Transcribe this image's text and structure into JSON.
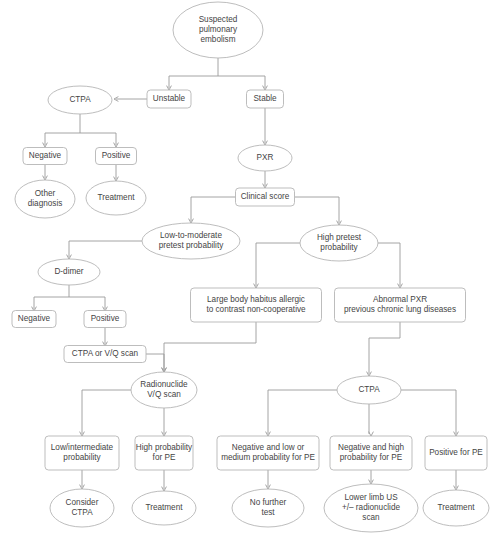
{
  "diagram": {
    "type": "flowchart",
    "colors": {
      "background": "#ffffff",
      "node_stroke": "#b5b5b5",
      "node_fill": "#ffffff",
      "edge_stroke": "#9a9a9a",
      "text": "#444444"
    },
    "nodes": [
      {
        "id": "suspected",
        "shape": "ellipse",
        "lines": [
          "Suspected",
          "pulmonary",
          "embolism"
        ],
        "cx": 218,
        "cy": 30,
        "rw": 45,
        "rh": 28
      },
      {
        "id": "unstable",
        "shape": "box",
        "lines": [
          "Unstable"
        ],
        "cx": 169,
        "cy": 99,
        "w": 44,
        "h": 18
      },
      {
        "id": "stable",
        "shape": "box",
        "lines": [
          "Stable"
        ],
        "cx": 265,
        "cy": 99,
        "w": 37,
        "h": 18
      },
      {
        "id": "ctpa_top",
        "shape": "ellipse",
        "lines": [
          "CTPA"
        ],
        "cx": 80,
        "cy": 100,
        "rw": 32,
        "rh": 14
      },
      {
        "id": "negative_top",
        "shape": "box",
        "lines": [
          "Negative"
        ],
        "cx": 45,
        "cy": 156,
        "w": 44,
        "h": 17
      },
      {
        "id": "positive_top",
        "shape": "box",
        "lines": [
          "Positive"
        ],
        "cx": 116,
        "cy": 156,
        "w": 41,
        "h": 17
      },
      {
        "id": "other_diag",
        "shape": "ellipse",
        "lines": [
          "Other",
          "diagnosis"
        ],
        "cx": 45,
        "cy": 199,
        "rw": 30,
        "rh": 19
      },
      {
        "id": "treatment_top",
        "shape": "ellipse",
        "lines": [
          "Treatment"
        ],
        "cx": 116,
        "cy": 198,
        "rw": 30,
        "rh": 17
      },
      {
        "id": "pxr",
        "shape": "ellipse",
        "lines": [
          "PXR"
        ],
        "cx": 265,
        "cy": 158,
        "rw": 27,
        "rh": 13
      },
      {
        "id": "clinical_score",
        "shape": "box",
        "lines": [
          "Clinical score"
        ],
        "cx": 265,
        "cy": 197,
        "w": 59,
        "h": 18
      },
      {
        "id": "low_mod",
        "shape": "ellipse",
        "lines": [
          "Low-to-moderate",
          "pretest probability"
        ],
        "cx": 191,
        "cy": 241,
        "rw": 49,
        "rh": 18
      },
      {
        "id": "high_pretest",
        "shape": "ellipse",
        "lines": [
          "High pretest",
          "probability"
        ],
        "cx": 339,
        "cy": 243,
        "rw": 39,
        "rh": 18
      },
      {
        "id": "d_dimer",
        "shape": "ellipse",
        "lines": [
          "D-dimer"
        ],
        "cx": 69,
        "cy": 272,
        "rw": 31,
        "rh": 13
      },
      {
        "id": "negative_dd",
        "shape": "box",
        "lines": [
          "Negative"
        ],
        "cx": 34,
        "cy": 319,
        "w": 44,
        "h": 17
      },
      {
        "id": "positive_dd",
        "shape": "box",
        "lines": [
          "Positive"
        ],
        "cx": 105,
        "cy": 319,
        "w": 42,
        "h": 17
      },
      {
        "id": "ctpa_vq",
        "shape": "box",
        "lines": [
          "CTPA or V/Q scan"
        ],
        "cx": 105,
        "cy": 354,
        "w": 82,
        "h": 17
      },
      {
        "id": "large_habitus",
        "shape": "box",
        "lines": [
          "Large body habitus allergic",
          "to contrast non-cooperative"
        ],
        "cx": 256,
        "cy": 305,
        "w": 131,
        "h": 34
      },
      {
        "id": "abnormal_pxr",
        "shape": "box",
        "lines": [
          "Abnormal PXR",
          "previous chronic lung diseases"
        ],
        "cx": 400,
        "cy": 305,
        "w": 131,
        "h": 34
      },
      {
        "id": "radionuclide",
        "shape": "ellipse",
        "lines": [
          "Radionuclide",
          "V/Q scan"
        ],
        "cx": 164,
        "cy": 390,
        "rw": 33,
        "rh": 18
      },
      {
        "id": "ctpa_bottom",
        "shape": "ellipse",
        "lines": [
          "CTPA"
        ],
        "cx": 369,
        "cy": 390,
        "rw": 32,
        "rh": 14
      },
      {
        "id": "low_inter",
        "shape": "box",
        "lines": [
          "Low/intermediate",
          "probability"
        ],
        "cx": 82,
        "cy": 453,
        "w": 74,
        "h": 34
      },
      {
        "id": "high_prob_pe",
        "shape": "box",
        "lines": [
          "High probability",
          "for PE"
        ],
        "cx": 164,
        "cy": 453,
        "w": 58,
        "h": 34
      },
      {
        "id": "neg_low_med",
        "shape": "box",
        "lines": [
          "Negative and low or",
          "medium probability for PE"
        ],
        "cx": 268,
        "cy": 453,
        "w": 102,
        "h": 34
      },
      {
        "id": "neg_high",
        "shape": "box",
        "lines": [
          "Negative and high",
          "probability for PE"
        ],
        "cx": 371,
        "cy": 453,
        "w": 82,
        "h": 34
      },
      {
        "id": "positive_pe",
        "shape": "box",
        "lines": [
          "Positive for PE"
        ],
        "cx": 456,
        "cy": 453,
        "w": 62,
        "h": 34
      },
      {
        "id": "consider_ctpa",
        "shape": "ellipse",
        "lines": [
          "Consider",
          "CTPA"
        ],
        "cx": 82,
        "cy": 508,
        "rw": 32,
        "rh": 19
      },
      {
        "id": "treatment_l",
        "shape": "ellipse",
        "lines": [
          "Treatment"
        ],
        "cx": 164,
        "cy": 508,
        "rw": 32,
        "rh": 17
      },
      {
        "id": "no_further",
        "shape": "ellipse",
        "lines": [
          "No further",
          "test"
        ],
        "cx": 268,
        "cy": 508,
        "rw": 36,
        "rh": 19
      },
      {
        "id": "lower_limb",
        "shape": "ellipse",
        "lines": [
          "Lower limb US",
          "+/– radionuclide",
          "scan"
        ],
        "cx": 371,
        "cy": 508,
        "rw": 47,
        "rh": 24
      },
      {
        "id": "treatment_r",
        "shape": "ellipse",
        "lines": [
          "Treatment"
        ],
        "cx": 456,
        "cy": 508,
        "rw": 33,
        "rh": 18
      }
    ],
    "edges": [
      {
        "from": "suspected",
        "to": "unstable",
        "path": "M218,58 L218,76 M169,76 L265,76 M169,76 L169,88",
        "arrow": "169,90"
      },
      {
        "from": "suspected",
        "to": "stable",
        "path": "M265,76 L265,88",
        "arrow": "265,90"
      },
      {
        "from": "unstable",
        "to": "ctpa_top",
        "path": "M147,99 L116,99",
        "arrow": "114,99",
        "dir": "left"
      },
      {
        "from": "ctpa_top",
        "to": "negative_top",
        "path": "M80,114 L80,133 M45,133 L116,133 M45,133 L45,145",
        "arrow": "45,147"
      },
      {
        "from": "ctpa_top",
        "to": "positive_top",
        "path": "M116,133 L116,145",
        "arrow": "116,147"
      },
      {
        "from": "negative_top",
        "to": "other_diag",
        "path": "M45,165 L45,178",
        "arrow": "45,180"
      },
      {
        "from": "positive_top",
        "to": "treatment_top",
        "path": "M116,165 L116,179",
        "arrow": "116,181"
      },
      {
        "from": "stable",
        "to": "pxr",
        "path": "M265,108 L265,143",
        "arrow": "265,145"
      },
      {
        "from": "pxr",
        "to": "clinical_score",
        "path": "M265,171 L265,186",
        "arrow": "265,188"
      },
      {
        "from": "clinical_score",
        "to": "low_mod",
        "path": "M236,197 L191,197 L191,221",
        "arrow": "191,223"
      },
      {
        "from": "clinical_score",
        "to": "high_pretest",
        "path": "M295,197 L339,197 L339,223",
        "arrow": "339,225"
      },
      {
        "from": "low_mod",
        "to": "d_dimer",
        "path": "M142,241 L69,241 L69,257",
        "arrow": "69,259"
      },
      {
        "from": "d_dimer",
        "to": "negative_dd",
        "path": "M69,285 L69,297 M34,297 L105,297 M34,297 L34,309",
        "arrow": "34,311"
      },
      {
        "from": "d_dimer",
        "to": "positive_dd",
        "path": "M105,297 L105,309",
        "arrow": "105,311"
      },
      {
        "from": "positive_dd",
        "to": "ctpa_vq",
        "path": "M105,328 L105,344",
        "arrow": "105,346"
      },
      {
        "from": "high_pretest",
        "to": "large_habitus",
        "path": "M300,243 L256,243 L256,286",
        "arrow": "256,288"
      },
      {
        "from": "high_pretest",
        "to": "abnormal_pxr",
        "path": "M378,243 L400,243 L400,286",
        "arrow": "400,288"
      },
      {
        "from": "ctpa_vq",
        "to": "radionuclide",
        "path": "M146,354 L164,354 L164,370",
        "arrow": "164,372"
      },
      {
        "from": "large_habitus",
        "to": "radionuclide",
        "path": "M256,322 L256,343 L164,343 L164,370",
        "arrow": "164,372"
      },
      {
        "from": "abnormal_pxr",
        "to": "ctpa_bottom",
        "path": "M400,322 L400,338 L369,338 L369,374",
        "arrow": "369,376"
      },
      {
        "from": "radionuclide",
        "to": "low_inter",
        "path": "M131,390 L82,390 L82,434",
        "arrow": "82,436"
      },
      {
        "from": "radionuclide",
        "to": "high_prob_pe",
        "path": "M164,408 L164,434",
        "arrow": "164,436"
      },
      {
        "from": "ctpa_bottom",
        "to": "neg_low_med",
        "path": "M337,390 L268,390 L268,434",
        "arrow": "268,436"
      },
      {
        "from": "ctpa_bottom",
        "to": "neg_high",
        "path": "M369,404 L369,434",
        "arrow": "371,436"
      },
      {
        "from": "ctpa_bottom",
        "to": "positive_pe",
        "path": "M401,390 L456,390 L456,434",
        "arrow": "456,436"
      },
      {
        "from": "low_inter",
        "to": "consider_ctpa",
        "path": "M82,470 L82,487",
        "arrow": "82,489"
      },
      {
        "from": "high_prob_pe",
        "to": "treatment_l",
        "path": "M164,470 L164,489",
        "arrow": "164,491"
      },
      {
        "from": "neg_low_med",
        "to": "no_further",
        "path": "M268,470 L268,487",
        "arrow": "268,489"
      },
      {
        "from": "neg_high",
        "to": "lower_limb",
        "path": "M371,470 L371,482",
        "arrow": "371,484"
      },
      {
        "from": "positive_pe",
        "to": "treatment_r",
        "path": "M456,470 L456,488",
        "arrow": "456,490"
      }
    ]
  }
}
